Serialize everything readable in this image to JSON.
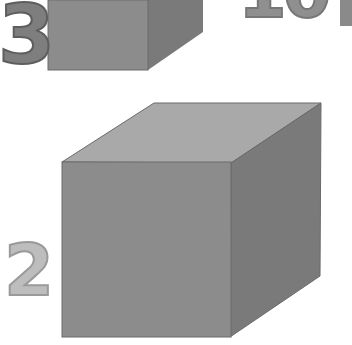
{
  "image": {
    "description": "Worksheet illustration of grey 3D cubes with numeric labels",
    "labels": [
      {
        "id": "label-3",
        "text": "3"
      },
      {
        "id": "label-10",
        "text": "10"
      },
      {
        "id": "label-2",
        "text": "2"
      }
    ],
    "cubes": [
      {
        "id": "small-cube-top",
        "label": "3"
      },
      {
        "id": "large-cube",
        "label": "2"
      }
    ],
    "colors": {
      "front_face": "#8c8c8c",
      "top_face": "#a9a9a9",
      "side_face": "#7a7a7a",
      "edge": "#6a6a6a",
      "background": "#ffffff"
    }
  }
}
